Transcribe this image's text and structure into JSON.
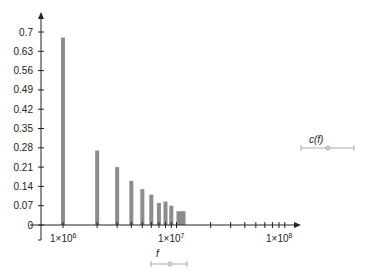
{
  "chart_data": {
    "type": "bar",
    "title": "",
    "xlabel": "f",
    "ylabel": "c(f)",
    "x_scale": "log",
    "x": [
      1000000,
      2000000,
      3000000,
      4000000,
      5000000,
      6000000,
      7000000,
      8000000,
      9000000,
      10000000
    ],
    "values": [
      0.68,
      0.27,
      0.21,
      0.16,
      0.13,
      0.11,
      0.08,
      0.085,
      0.07,
      0.05
    ],
    "ylim": [
      0,
      0.7
    ],
    "yticks": [
      0,
      0.07,
      0.14,
      0.21,
      0.28,
      0.35,
      0.42,
      0.49,
      0.56,
      0.63,
      0.7
    ],
    "ytick_labels": [
      "0",
      "0.07",
      "0.14",
      "0.21",
      "0.28",
      "0.35",
      "0.42",
      "0.49",
      "0.56",
      "0.63",
      "0.7"
    ],
    "xticks": [
      1000000,
      10000000,
      100000000
    ],
    "xtick_labels": [
      "1×10^6",
      "1×10^7",
      "1×10^8"
    ],
    "grid": false,
    "bar_color": "#8c8c8c",
    "axis_color": "#222222"
  },
  "labels": {
    "x_axis": "f",
    "c_axis": "c(f)",
    "xtick_base": "1×10",
    "xtick_exp": [
      "6",
      "7",
      "8"
    ]
  },
  "sliders": {
    "f": {
      "label": "f"
    },
    "cf": {
      "label": "c(f)"
    }
  }
}
